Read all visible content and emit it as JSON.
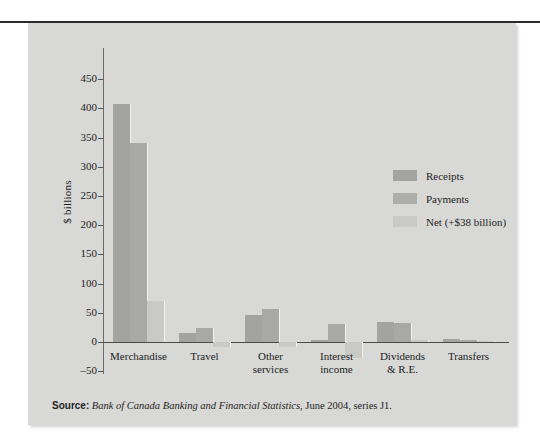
{
  "figure": {
    "background_color": "#d8d8d6",
    "ylabel": "$ billions",
    "source_prefix": "Source:",
    "source_italic": "Bank of Canada Banking and Financial Statistics",
    "source_rest": ", June 2004, series J1."
  },
  "legend": {
    "position": "upper-right",
    "items": [
      {
        "label": "Receipts",
        "color": "#a3a3a0"
      },
      {
        "label": "Payments",
        "color": "#adadaa"
      },
      {
        "label": "Net (+$38 billion)",
        "color": "#c9c9c6"
      }
    ]
  },
  "chart_data": {
    "type": "bar",
    "title": "",
    "xlabel": "",
    "ylabel": "$ billions",
    "ylim": [
      -50,
      450
    ],
    "yticks": [
      450,
      400,
      350,
      300,
      250,
      200,
      150,
      100,
      50,
      0,
      -50
    ],
    "ytick_labels": [
      "450",
      "400",
      "350",
      "300",
      "250",
      "200",
      "150",
      "100",
      "50",
      "0",
      "–50"
    ],
    "grid": false,
    "categories": [
      "Merchandise",
      "Travel",
      "Other services",
      "Interest income",
      "Dividends & R.E.",
      "Transfers"
    ],
    "category_lines": [
      [
        "Merchandise"
      ],
      [
        "Travel"
      ],
      [
        "Other",
        "services"
      ],
      [
        "Interest",
        "income"
      ],
      [
        "Dividends",
        "& R.E."
      ],
      [
        "Transfers"
      ]
    ],
    "series": [
      {
        "name": "Receipts",
        "color": "#a3a3a0",
        "values": [
          407,
          15,
          47,
          4,
          35,
          5
        ]
      },
      {
        "name": "Payments",
        "color": "#adadaa",
        "values": [
          340,
          24,
          56,
          31,
          32,
          3
        ]
      },
      {
        "name": "Net (+$38 billion)",
        "color": "#c9c9c6",
        "values": [
          71,
          -9,
          -9,
          -27,
          3,
          2
        ]
      }
    ]
  }
}
